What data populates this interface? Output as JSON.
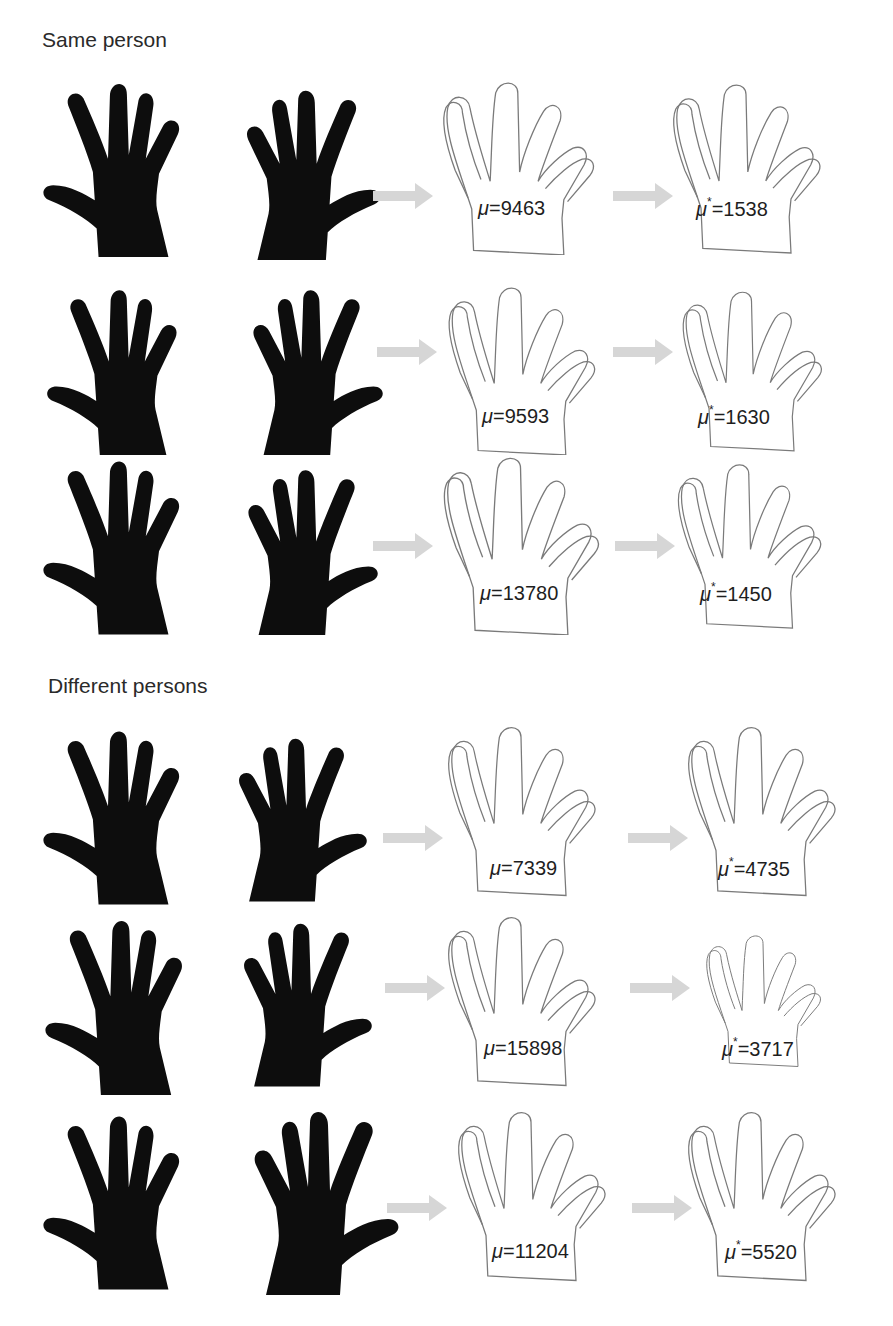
{
  "sections": [
    {
      "title": "Same person",
      "rows": [
        {
          "initial_label": "μ=9463",
          "initial_value": 9463,
          "aligned_label": "μ*=1538",
          "aligned_value": 1538
        },
        {
          "initial_label": "μ=9593",
          "initial_value": 9593,
          "aligned_label": "μ*=1630",
          "aligned_value": 1630
        },
        {
          "initial_label": "μ=13780",
          "initial_value": 13780,
          "aligned_label": "μ*=1450",
          "aligned_value": 1450
        }
      ]
    },
    {
      "title": "Different persons",
      "rows": [
        {
          "initial_label": "μ=7339",
          "initial_value": 7339,
          "aligned_label": "μ*=4735",
          "aligned_value": 4735
        },
        {
          "initial_label": "μ=15898",
          "initial_value": 15898,
          "aligned_label": "μ*=3717",
          "aligned_value": 3717
        },
        {
          "initial_label": "μ=11204",
          "initial_value": 11204,
          "aligned_label": "μ*=5520",
          "aligned_value": 5520
        }
      ]
    }
  ],
  "labels": {
    "mu_symbol": "μ",
    "mu_star_symbol": "μ",
    "star": "*",
    "same": [
      "9463",
      "1538",
      "9593",
      "1630",
      "13780",
      "1450"
    ],
    "diff": [
      "7339",
      "4735",
      "15898",
      "3717",
      "11204",
      "5520"
    ],
    "eq": "="
  },
  "colors": {
    "silhouette": "#0d0d0d",
    "outline": "#7a7a7a",
    "arrow": "#d6d6d6",
    "text": "#1e1e1e"
  }
}
